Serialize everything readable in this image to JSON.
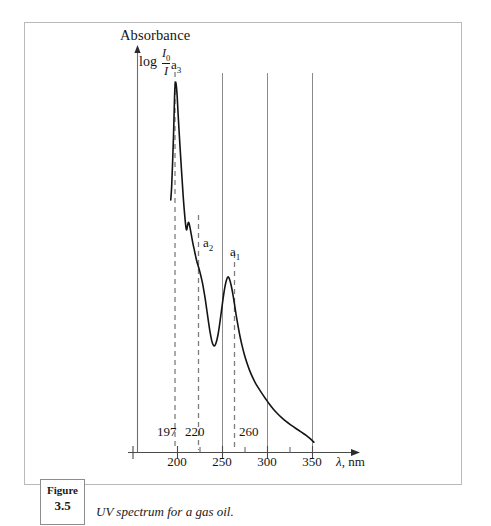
{
  "figure": {
    "box_word": "Figure",
    "box_number": "3.5",
    "caption": "UV spectrum for a gas oil."
  },
  "chart_data": {
    "type": "line",
    "title": "Absorbance",
    "ylabel_prefix": "log",
    "ylabel_numerator": "I",
    "ylabel_numerator_sub": "0",
    "ylabel_denominator": "I",
    "xlabel_symbol": "λ",
    "xlabel_unit": ", nm",
    "xlim": [
      185,
      365
    ],
    "ylim": [
      0,
      1
    ],
    "grid": "vertical-lines-at-250-300-350",
    "legend": "none",
    "x_ticks": [
      200,
      250,
      300,
      350
    ],
    "x_tick_labels": [
      "200",
      "250",
      "300",
      "350"
    ],
    "minor_ticks": [
      187,
      225,
      275,
      325
    ],
    "gridlines": [
      250,
      300,
      350
    ],
    "annotations": [
      {
        "name": "a3",
        "label": "a",
        "sub": "3",
        "wavelength": 197,
        "value_label": "197"
      },
      {
        "name": "a2",
        "label": "a",
        "sub": "2",
        "wavelength": 220,
        "value_label": "220"
      },
      {
        "name": "a1",
        "label": "a",
        "sub": "1",
        "wavelength": 260,
        "value_label": "260"
      }
    ],
    "series": [
      {
        "name": "UV absorbance of gas oil",
        "x": [
          192.5,
          193.5,
          194.5,
          195.5,
          196.3,
          197.0,
          197.8,
          198.6,
          199.6,
          200.6,
          201.8,
          203.2,
          204.8,
          206.4,
          208.0,
          209.2,
          210.2,
          211.2,
          212.2,
          213.2,
          214.4,
          215.6,
          217.0,
          218.6,
          220.2,
          221.8,
          223.6,
          225.4,
          227.2,
          229.0,
          230.8,
          232.6,
          234.4,
          236.2,
          238.0,
          239.8,
          241.6,
          243.4,
          245.2,
          247.0,
          248.8,
          250.6,
          252.4,
          254.2,
          256.0,
          257.8,
          259.6,
          261.4,
          263.2,
          265.0,
          267.0,
          269.2,
          271.6,
          274.2,
          277.0,
          280.0,
          283.2,
          286.6,
          290.2,
          294.0,
          298.0,
          302.2,
          306.6,
          311.2,
          316.0,
          321.0,
          326.2,
          331.6,
          337.2,
          343.0,
          348.0,
          351.5
        ],
        "y": [
          0.665,
          0.7,
          0.76,
          0.83,
          0.9,
          0.955,
          0.975,
          0.968,
          0.94,
          0.895,
          0.845,
          0.79,
          0.73,
          0.672,
          0.625,
          0.596,
          0.586,
          0.598,
          0.606,
          0.6,
          0.586,
          0.57,
          0.552,
          0.534,
          0.516,
          0.5,
          0.486,
          0.47,
          0.452,
          0.43,
          0.404,
          0.374,
          0.344,
          0.316,
          0.294,
          0.282,
          0.281,
          0.292,
          0.312,
          0.34,
          0.372,
          0.404,
          0.432,
          0.452,
          0.462,
          0.456,
          0.44,
          0.418,
          0.392,
          0.364,
          0.336,
          0.308,
          0.282,
          0.258,
          0.236,
          0.216,
          0.198,
          0.182,
          0.168,
          0.154,
          0.14,
          0.126,
          0.113,
          0.101,
          0.09,
          0.08,
          0.071,
          0.062,
          0.053,
          0.044,
          0.034,
          0.026
        ]
      }
    ]
  }
}
